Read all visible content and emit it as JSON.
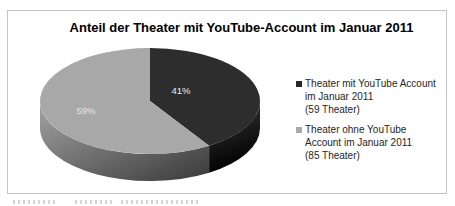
{
  "chart_data": {
    "type": "pie",
    "style": "3d",
    "title": "Anteil der Theater mit YouTube-Account im Januar 2011",
    "labels": [
      "Theater mit YouTube Account im Januar 2011 (59 Theater)",
      "Theater ohne YouTube Account im Januar 2011 (85 Theater)"
    ],
    "values": [
      59,
      85
    ],
    "percentages": [
      41,
      59
    ],
    "percent_labels": [
      "41%",
      "59%"
    ],
    "start_angle_deg": 0,
    "legend_position": "right",
    "slice_colors": [
      "#2d2d2d",
      "#a8a8a8"
    ],
    "slice_side_gradients": [
      [
        "#3a3a3a",
        "#000000"
      ],
      [
        "#9b9b9b",
        "#3f3f3f"
      ]
    ],
    "percent_label_colors": [
      "#ededed",
      "#e4e4e4"
    ]
  },
  "legend": {
    "items": [
      {
        "swatch_color": "#262626",
        "lines": [
          "Theater mit YouTube Account",
          "im Januar 2011",
          "(59 Theater)"
        ]
      },
      {
        "swatch_color": "#a8a8a8",
        "lines": [
          "Theater ohne YouTube",
          "Account im Januar 2011",
          "(85 Theater)"
        ]
      }
    ]
  },
  "colors": {
    "frame_border": "#c4c4c4",
    "title_text": "#000000",
    "legend_text": "#262626",
    "background": "#ffffff"
  }
}
